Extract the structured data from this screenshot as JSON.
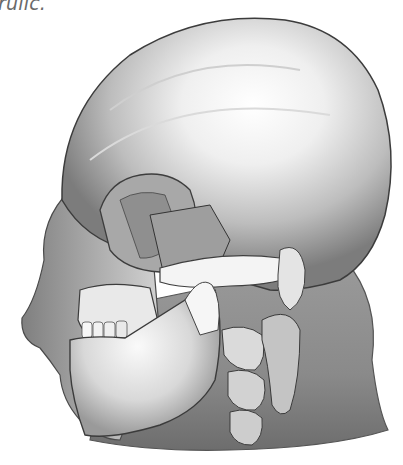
{
  "caption": {
    "text_fragment": "rulic."
  },
  "figure": {
    "rendering": "grayscale",
    "palette": {
      "background": "#ffffff",
      "highlight": "#fbfbfb",
      "bone_mid": "#c9c9c9",
      "skin_shadow": "#8e8e8e",
      "deep_shadow": "#3c3c3c",
      "caption_text": "#6a6a6a"
    },
    "visible_structures": [
      "cranium",
      "orbit",
      "zygomatic-arch",
      "maxilla",
      "mandible",
      "teeth",
      "cervical-vertebrae",
      "soft-tissue-nose",
      "neck-soft-tissue"
    ]
  }
}
